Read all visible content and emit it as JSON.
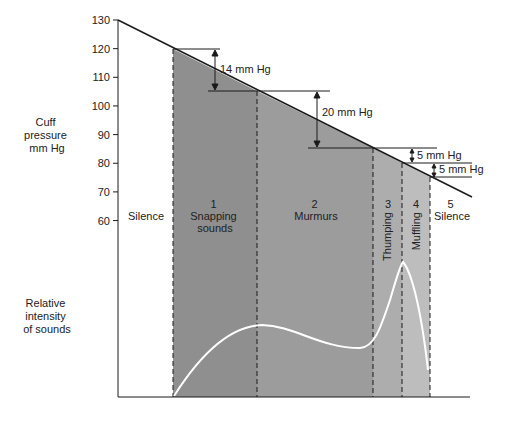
{
  "colors": {
    "zone1": "#8f8f8f",
    "zone2": "#9c9c9c",
    "zone3": "#adadad",
    "zone4": "#bdbdbd",
    "line": "#1a1a1a",
    "curve": "#ffffff"
  },
  "y_axis": {
    "label_lines": [
      "Cuff",
      "pressure",
      "mm Hg"
    ],
    "ticks": [
      130,
      120,
      110,
      100,
      90,
      80,
      70,
      60
    ]
  },
  "intensity_axis": {
    "label_lines": [
      "Relative",
      "intensity",
      "of sounds"
    ]
  },
  "pressure_line": {
    "start": 130,
    "points": [
      120,
      106,
      86,
      81,
      76
    ]
  },
  "zones": [
    {
      "number": "",
      "label": "Silence",
      "orientation": "horizontal"
    },
    {
      "number": "1",
      "label_lines": [
        "Snapping",
        "sounds"
      ],
      "orientation": "horizontal"
    },
    {
      "number": "2",
      "label_lines": [
        "Murmurs"
      ],
      "orientation": "horizontal"
    },
    {
      "number": "3",
      "label_lines": [
        "Thumping"
      ],
      "orientation": "vertical"
    },
    {
      "number": "4",
      "label_lines": [
        "Muffling"
      ],
      "orientation": "vertical"
    },
    {
      "number": "5",
      "label_lines": [
        "Silence"
      ],
      "orientation": "horizontal"
    }
  ],
  "annotations": [
    "14 mm Hg",
    "20 mm Hg",
    "5 mm Hg",
    "5 mm Hg"
  ]
}
